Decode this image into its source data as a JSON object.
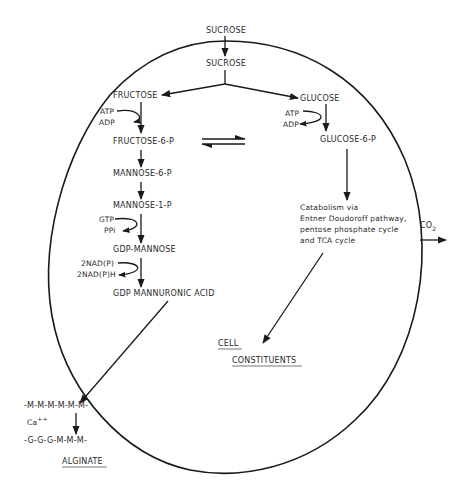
{
  "diagram": {
    "type": "metabolic-pathway",
    "external_substrate": "SUCROSE",
    "internal_substrate": "SUCROSE",
    "left_branch": {
      "start": "FRUCTOSE",
      "steps": [
        {
          "cofactor_in": "ATP",
          "cofactor_out": "ADP",
          "product": "FRUCTOSE-6-P"
        },
        {
          "product": "MANNOSE-6-P"
        },
        {
          "product": "MANNOSE-1-P"
        },
        {
          "cofactor_in": "GTP",
          "cofactor_out": "PPi",
          "product": "GDP-MANNOSE"
        },
        {
          "cofactor_in": "2NAD(P)",
          "cofactor_out": "2NAD(P)H",
          "product": "GDP MANNURONIC ACID"
        }
      ]
    },
    "right_branch": {
      "start": "GLUCOSE",
      "cofactor_in": "ATP",
      "cofactor_out": "ADP",
      "product": "GLUCOSE-6-P",
      "catabolism_text": [
        "Catabolism via",
        "Entner Doudoroff pathway,",
        "pentose phosphate cycle",
        "and TCA cycle"
      ]
    },
    "output_gas": {
      "label": "CO",
      "subscript": "2"
    },
    "cell_constituents": {
      "line1": "CELL",
      "line2": "CONSTITUENTS"
    },
    "alginate": {
      "chain_top": "-M-M-M-M-M-M-",
      "ion": "Ca",
      "ion_charge": "++",
      "chain_bottom": "-G-G-G-M-M-M-",
      "label": "ALGINATE"
    },
    "equilibrium_symbol": "⇌"
  }
}
